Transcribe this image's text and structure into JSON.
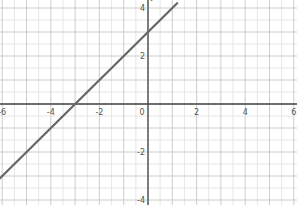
{
  "chart_data": {
    "type": "line",
    "title": "",
    "xlabel": "",
    "ylabel": "y",
    "xlim": [
      -6,
      6
    ],
    "ylim": [
      -4,
      4
    ],
    "grid": true,
    "x_ticks": [
      -6,
      -4,
      -2,
      0,
      2,
      4,
      6
    ],
    "y_ticks": [
      -4,
      -2,
      2,
      4
    ],
    "x_tick_labels": [
      "-6",
      "-4",
      "-2",
      "0",
      "2",
      "4",
      "6"
    ],
    "y_tick_labels": [
      "-4",
      "-2",
      "2",
      "4"
    ],
    "series": [
      {
        "name": "y = x + 3",
        "equation": "y = x + 3",
        "slope": 1,
        "intercept": 3,
        "x": [
          -6.1,
          1.2
        ],
        "y": [
          -3.1,
          4.2
        ],
        "x_intercept": -3,
        "y_intercept": 3,
        "color": "#666666"
      }
    ]
  },
  "colors": {
    "axis": "#444444",
    "grid_major": "#cccccc",
    "grid_minor": "#e6e6e6",
    "line": "#666666"
  }
}
